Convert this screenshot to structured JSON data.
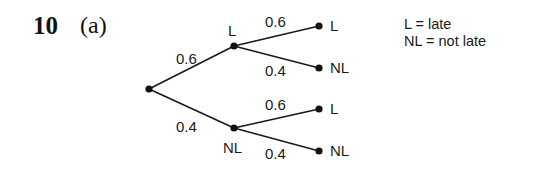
{
  "question": {
    "number": "10",
    "part": "(a)"
  },
  "key": [
    "L = late",
    "NL = not late"
  ],
  "tree": {
    "root": {},
    "branches": [
      {
        "outcome": "L",
        "probability": "0.6",
        "children": [
          {
            "outcome": "L",
            "probability": "0.6"
          },
          {
            "outcome": "NL",
            "probability": "0.4"
          }
        ]
      },
      {
        "outcome": "NL",
        "probability": "0.4",
        "children": [
          {
            "outcome": "L",
            "probability": "0.6"
          },
          {
            "outcome": "NL",
            "probability": "0.4"
          }
        ]
      }
    ]
  }
}
